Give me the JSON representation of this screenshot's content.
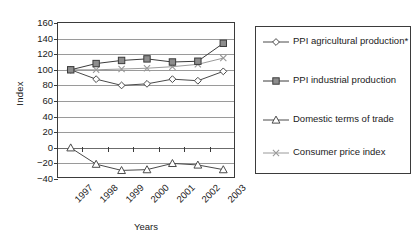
{
  "chart_data": {
    "type": "line",
    "title": "",
    "xlabel": "Years",
    "ylabel": "Index",
    "categories": [
      "1997",
      "1998",
      "1999",
      "2000",
      "2001",
      "2002",
      "2003"
    ],
    "x": [
      1997,
      1998,
      1999,
      2000,
      2001,
      2002,
      2003
    ],
    "ylim": [
      -40,
      160
    ],
    "ytick_step": 20,
    "yticks": [
      160,
      140,
      120,
      100,
      80,
      60,
      40,
      20,
      0,
      -20,
      -40
    ],
    "ytick_labels": [
      "160",
      "140",
      "120",
      "100",
      "80",
      "60",
      "40",
      "20",
      "0",
      "−20",
      "−40"
    ],
    "grid": "horizontal",
    "legend_position": "right-outside",
    "series": [
      {
        "name": "PPI agricultural production*",
        "marker": "open-diamond",
        "color": "#4a4a4a",
        "values": [
          100,
          88,
          80,
          82,
          88,
          86,
          98
        ]
      },
      {
        "name": "PPI industrial production",
        "marker": "filled-square",
        "color": "#3b3b3b",
        "values": [
          100,
          108,
          112,
          114,
          110,
          111,
          134
        ]
      },
      {
        "name": "Domestic terms of trade",
        "marker": "open-triangle",
        "color": "#4a4a4a",
        "values": [
          0,
          -21,
          -29,
          -28,
          -20,
          -22,
          -28
        ]
      },
      {
        "name": "Consumer price index",
        "marker": "cross-x",
        "color": "#9a9a9a",
        "values": [
          100,
          100,
          101,
          102,
          104,
          107,
          115
        ]
      }
    ]
  },
  "axes": {
    "y_title": "Index",
    "x_title": "Years"
  },
  "legend": {
    "entries": [
      {
        "label": "PPI agricultural production*",
        "marker": "diamond-marker-icon"
      },
      {
        "label": "PPI industrial production",
        "marker": "square-marker-icon"
      },
      {
        "label": "Domestic terms of trade",
        "marker": "triangle-marker-icon"
      },
      {
        "label": "Consumer price index",
        "marker": "cross-marker-icon"
      }
    ]
  },
  "colors": {
    "axis": "#3b3b3b",
    "grid": "#9a9a9a",
    "square_fill": "#8d8d8d",
    "cpi_line": "#9a9a9a",
    "background": "#ffffff"
  }
}
